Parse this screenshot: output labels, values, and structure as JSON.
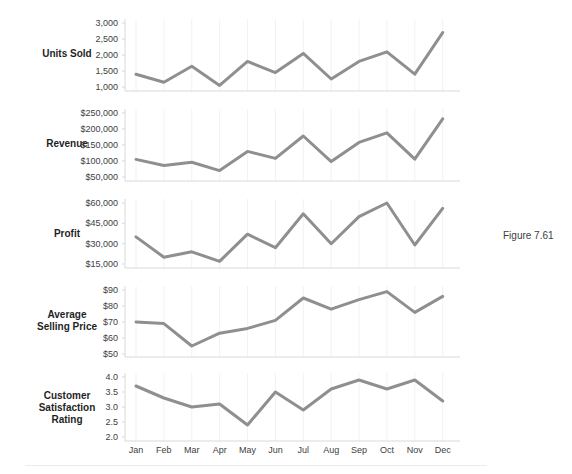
{
  "figure_caption": "Figure 7.61",
  "colors": {
    "line": "#8f8f8f",
    "axis": "#d9d9d9",
    "grid": "#f2f2f2",
    "tick_text": "#404040",
    "month_text": "#404040",
    "metric_label_text": "#1f1f1f",
    "background": "#ffffff"
  },
  "chart_data": {
    "type": "line",
    "layout": "five stacked sparkline panels, shared month x-axis, left value axis per panel, no markers, legend off",
    "categories": [
      "Jan",
      "Feb",
      "Mar",
      "Apr",
      "May",
      "Jun",
      "Jul",
      "Aug",
      "Sep",
      "Oct",
      "Nov",
      "Dec"
    ],
    "series": [
      {
        "name": "Units Sold",
        "tick_labels": [
          "3,000",
          "2,500",
          "2,000",
          "1,500",
          "1,000"
        ],
        "tick_values": [
          3000,
          2500,
          2000,
          1500,
          1000
        ],
        "ylim": [
          1000,
          3000
        ],
        "values": [
          1400,
          1150,
          1650,
          1050,
          1800,
          1450,
          2050,
          1250,
          1800,
          2100,
          1400,
          2700
        ]
      },
      {
        "name": "Revenue",
        "tick_labels": [
          "$250,000",
          "$200,000",
          "$150,000",
          "$100,000",
          "$50,000"
        ],
        "tick_values": [
          250000,
          200000,
          150000,
          100000,
          50000
        ],
        "ylim": [
          50000,
          250000
        ],
        "values": [
          105000,
          86000,
          96000,
          70000,
          130000,
          108000,
          178000,
          98000,
          158000,
          188000,
          106000,
          232000
        ]
      },
      {
        "name": "Profit",
        "tick_labels": [
          "$60,000",
          "$45,000",
          "$30,000",
          "$15,000"
        ],
        "tick_values": [
          60000,
          45000,
          30000,
          15000
        ],
        "ylim": [
          15000,
          60000
        ],
        "values": [
          35000,
          20000,
          24000,
          17000,
          37000,
          27000,
          52000,
          30000,
          50000,
          60000,
          29000,
          56000
        ]
      },
      {
        "name": "Average Selling Price",
        "tick_labels": [
          "$90",
          "$80",
          "$70",
          "$60",
          "$50"
        ],
        "tick_values": [
          90,
          80,
          70,
          60,
          50
        ],
        "ylim": [
          50,
          90
        ],
        "values": [
          70,
          69,
          55,
          63,
          66,
          71,
          85,
          78,
          84,
          89,
          76,
          86
        ]
      },
      {
        "name": "Customer Satisfaction Rating",
        "tick_labels": [
          "4.0",
          "3.5",
          "3.0",
          "2.5",
          "2.0"
        ],
        "tick_values": [
          4.0,
          3.5,
          3.0,
          2.5,
          2.0
        ],
        "ylim": [
          2.0,
          4.0
        ],
        "values": [
          3.7,
          3.3,
          3.0,
          3.1,
          2.4,
          3.5,
          2.9,
          3.6,
          3.9,
          3.6,
          3.9,
          3.2
        ]
      }
    ]
  }
}
